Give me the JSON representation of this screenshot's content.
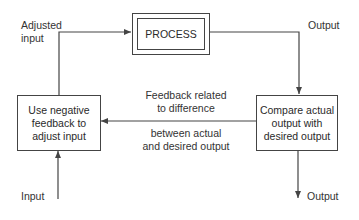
{
  "diagram": {
    "process_box": {
      "label": "PROCESS"
    },
    "left_box": {
      "line1": "Use negative",
      "line2": "feedback to",
      "line3": "adjust input"
    },
    "right_box": {
      "line1": "Compare actual",
      "line2": "output with",
      "line3": "desired output"
    },
    "labels": {
      "adjusted_input_1": "Adjusted",
      "adjusted_input_2": "input",
      "output_top": "Output",
      "output_bottom": "Output",
      "input_bottom": "Input",
      "feedback_above_1": "Feedback related",
      "feedback_above_2": "to difference",
      "feedback_below_1": "between actual",
      "feedback_below_2": "and desired output"
    },
    "colors": {
      "line": "#444444",
      "text": "#2a2a2a",
      "background": "#ffffff"
    }
  }
}
